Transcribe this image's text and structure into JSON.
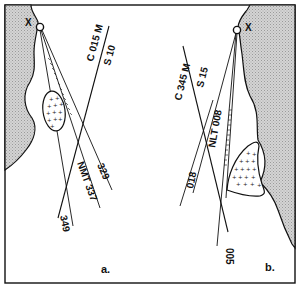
{
  "panels": [
    {
      "id": "a",
      "caption": "a.",
      "origin_marker": "X",
      "course_label": "C 015 M",
      "speed_label": "S 10",
      "bearings": [
        "329",
        "NMT 337",
        "349"
      ],
      "area_symbol": "crosses-ellipse"
    },
    {
      "id": "b",
      "caption": "b.",
      "origin_marker": "X",
      "course_label": "C 345 M",
      "speed_label": "S 15",
      "bearings": [
        "NLT 008",
        "018",
        "005"
      ],
      "area_symbol": "crosses-patch"
    }
  ],
  "colors": {
    "ink": "#111111",
    "land": "#c8c8c8",
    "background": "#ffffff"
  }
}
